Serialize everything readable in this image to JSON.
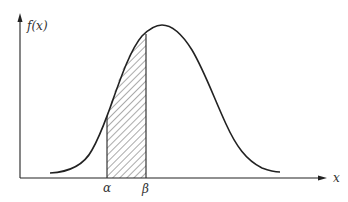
{
  "figure": {
    "type": "normal-distribution-diagram",
    "y_axis_label": "f(x)",
    "x_axis_label": "x",
    "lower_bound_label": "α",
    "upper_bound_label": "β",
    "shaded_region": "area under curve between α and β",
    "colors": {
      "stroke": "#222222",
      "hatch": "#444444",
      "background": "#ffffff"
    }
  }
}
